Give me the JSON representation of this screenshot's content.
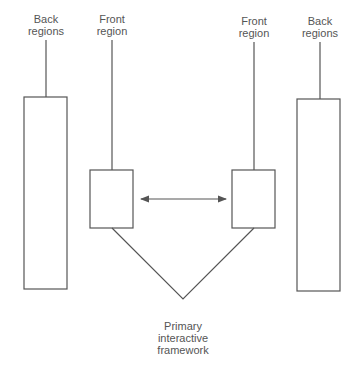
{
  "diagram": {
    "type": "region-framework",
    "labels": {
      "back_left": "Back\nregions",
      "front_left": "Front\nregion",
      "front_right": "Front\nregion",
      "back_right": "Back\nregions",
      "primary": "Primary\ninteractive\nframework"
    },
    "nodes": [
      {
        "id": "back-left",
        "label": "Back regions"
      },
      {
        "id": "front-left",
        "label": "Front region"
      },
      {
        "id": "front-right",
        "label": "Front region"
      },
      {
        "id": "back-right",
        "label": "Back regions"
      },
      {
        "id": "primary",
        "label": "Primary interactive framework"
      }
    ],
    "edges": [
      {
        "from": "front-left",
        "to": "front-right",
        "style": "double-arrow"
      },
      {
        "from": "front-left",
        "to": "primary",
        "style": "line"
      },
      {
        "from": "front-right",
        "to": "primary",
        "style": "line"
      }
    ],
    "colors": {
      "stroke": "#555555",
      "background": "#ffffff"
    }
  }
}
